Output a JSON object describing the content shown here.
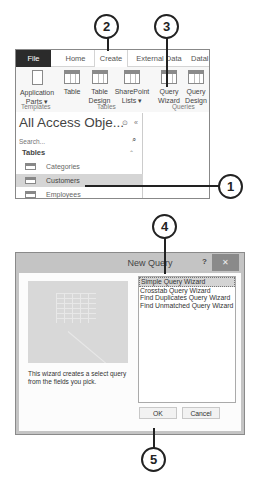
{
  "callouts": [
    {
      "id": "1",
      "label": "1"
    },
    {
      "id": "2",
      "label": "2"
    },
    {
      "id": "3",
      "label": "3"
    },
    {
      "id": "4",
      "label": "4"
    },
    {
      "id": "5",
      "label": "5"
    }
  ],
  "ribbon": {
    "tabs": [
      "File",
      "Home",
      "Create",
      "External Data",
      "Datal"
    ],
    "active_tab": "Create",
    "buttons": [
      {
        "line1": "Application",
        "line2": "Parts ▾",
        "icon": "application-parts-icon"
      },
      {
        "line1": "Table",
        "line2": "",
        "icon": "table-icon"
      },
      {
        "line1": "Table",
        "line2": "Design",
        "icon": "table-design-icon"
      },
      {
        "line1": "SharePoint",
        "line2": "Lists ▾",
        "icon": "sharepoint-lists-icon"
      },
      {
        "line1": "Query",
        "line2": "Wizard",
        "icon": "query-wizard-icon"
      },
      {
        "line1": "Query",
        "line2": "Design",
        "icon": "query-design-icon"
      }
    ],
    "groups": [
      "Templates",
      "Tables",
      "Queries"
    ]
  },
  "nav_pane": {
    "title": "All Access Obje...",
    "menu_icon": "⊙",
    "collapse_icon": "«",
    "search_placeholder": "Search...",
    "search_icon": "⌕",
    "section": "Tables",
    "section_icon": "⌃",
    "items": [
      "Categories",
      "Customers",
      "Employees"
    ],
    "selected": "Customers"
  },
  "dialog": {
    "title": "New Query",
    "help": "?",
    "close": "✕",
    "description": "This wizard creates a select query from the fields you pick.",
    "options": [
      "Simple Query Wizard",
      "Crosstab Query Wizard",
      "Find Duplicates Query Wizard",
      "Find Unmatched Query Wizard"
    ],
    "selected": "Simple Query Wizard",
    "ok_label": "OK",
    "cancel_label": "Cancel"
  }
}
